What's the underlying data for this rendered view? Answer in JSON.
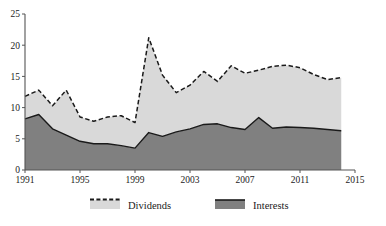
{
  "chart_data": {
    "type": "area",
    "stacked": true,
    "title": "",
    "subtitle": "",
    "xlabel": "",
    "ylabel": "",
    "xlim": [
      1991,
      2015
    ],
    "ylim": [
      0,
      25
    ],
    "grid": false,
    "legend_position": "bottom",
    "x": [
      1991,
      1992,
      1993,
      1994,
      1995,
      1996,
      1997,
      1998,
      1999,
      2000,
      2001,
      2002,
      2003,
      2004,
      2005,
      2006,
      2007,
      2008,
      2009,
      2010,
      2011,
      2012,
      2013,
      2014
    ],
    "xtick_labels": [
      "1991",
      "1995",
      "1999",
      "2003",
      "2007",
      "2011",
      "2015"
    ],
    "xtick_values": [
      1991,
      1995,
      1999,
      2003,
      2007,
      2011,
      2015
    ],
    "ytick_labels": [
      "0",
      "5",
      "10",
      "15",
      "20",
      "25"
    ],
    "ytick_values": [
      0,
      5,
      10,
      15,
      20,
      25
    ],
    "series": [
      {
        "name": "Interests",
        "color": "#808080",
        "values": [
          8.2,
          8.9,
          6.6,
          5.6,
          4.6,
          4.2,
          4.2,
          3.9,
          3.5,
          6.0,
          5.4,
          6.1,
          6.6,
          7.3,
          7.4,
          6.8,
          6.5,
          8.4,
          6.7,
          6.9,
          6.8,
          6.7,
          6.5,
          6.3
        ]
      },
      {
        "name": "Dividends",
        "color": "#d9d9d9",
        "values": [
          3.6,
          3.9,
          3.7,
          7.2,
          3.9,
          3.6,
          4.3,
          4.8,
          4.1,
          15.2,
          9.8,
          6.3,
          7.0,
          8.5,
          6.8,
          9.9,
          9.0,
          7.6,
          9.9,
          9.9,
          9.6,
          8.6,
          8.0,
          8.5
        ]
      }
    ],
    "total_line": {
      "name": "Total",
      "style": "dashed",
      "color": "#1a1a1a",
      "values": [
        11.8,
        12.8,
        10.3,
        12.8,
        8.5,
        7.8,
        8.5,
        8.7,
        7.6,
        21.2,
        15.2,
        12.4,
        13.6,
        15.8,
        14.2,
        16.7,
        15.5,
        16.0,
        16.6,
        16.8,
        16.4,
        15.3,
        14.5,
        14.8
      ]
    }
  },
  "legend": {
    "items": [
      {
        "label": "Dividends",
        "swatch_color": "#d9d9d9",
        "has_dashed_top": true
      },
      {
        "label": "Interests",
        "swatch_color": "#808080",
        "has_dashed_top": false
      }
    ]
  },
  "axes": {
    "axis_color": "#555555",
    "line_color": "#1a1a1a"
  }
}
